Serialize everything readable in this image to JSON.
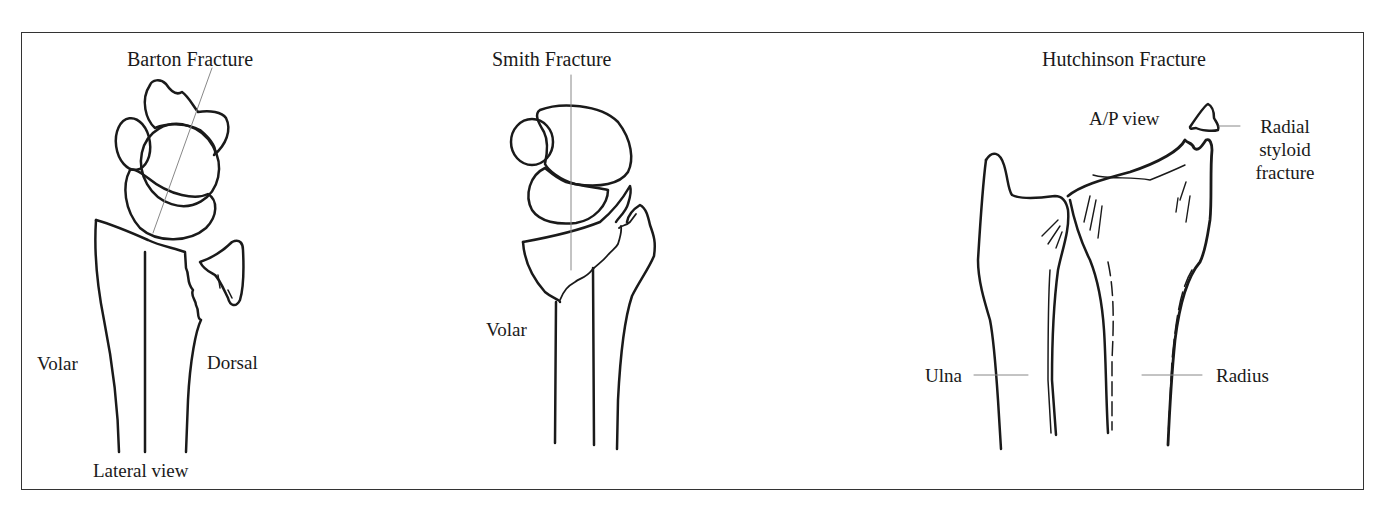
{
  "panels": [
    {
      "id": "barton",
      "title": "Barton Fracture",
      "labels": {
        "left": "Volar",
        "right": "Dorsal",
        "bottom": "Lateral view"
      }
    },
    {
      "id": "smith",
      "title": "Smith Fracture",
      "labels": {
        "left": "Volar"
      }
    },
    {
      "id": "hutchinson",
      "title": "Hutchinson Fracture",
      "labels": {
        "view": "A/P view",
        "fragment_line1": "Radial",
        "fragment_line2": "styloid",
        "fragment_line3": "fracture",
        "ulna": "Ulna",
        "radius": "Radius"
      }
    }
  ],
  "colors": {
    "ink": "#1a1a1a",
    "leader": "#888888",
    "border": "#333333",
    "background": "#ffffff"
  }
}
